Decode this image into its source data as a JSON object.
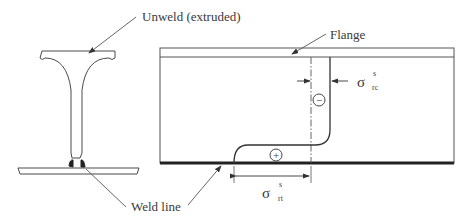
{
  "diagram": {
    "labels": {
      "unweld": "Unweld (extruded)",
      "flange": "Flange",
      "weld_line": "Weld line"
    },
    "stress_symbols": {
      "compression": {
        "symbol": "σ",
        "sup": "s",
        "sub": "rc"
      },
      "tension": {
        "symbol": "σ",
        "sup": "s",
        "sub": "rt"
      }
    },
    "zone_signs": {
      "compression": "−",
      "tension": "+"
    },
    "colors": {
      "line": "#4a4a4a",
      "thick_line": "#222222",
      "background": "#ffffff"
    }
  }
}
